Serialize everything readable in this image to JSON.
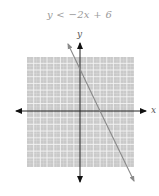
{
  "title": "y < −2x + 6",
  "axes": {
    "x_label": "x",
    "y_label": "y"
  },
  "graph": {
    "inequality": "y < -2x + 6",
    "boundary": {
      "slope": -2,
      "intercept": 6,
      "style": "solid"
    },
    "x_range": [
      -8,
      8
    ],
    "y_range": [
      -8,
      8
    ],
    "shaded_region": "entire grid shaded gray",
    "colors": {
      "shade": "#c8c8c8",
      "grid_line": "#ffffff",
      "axis": "#222222",
      "boundary": "#8a8a8a"
    }
  }
}
